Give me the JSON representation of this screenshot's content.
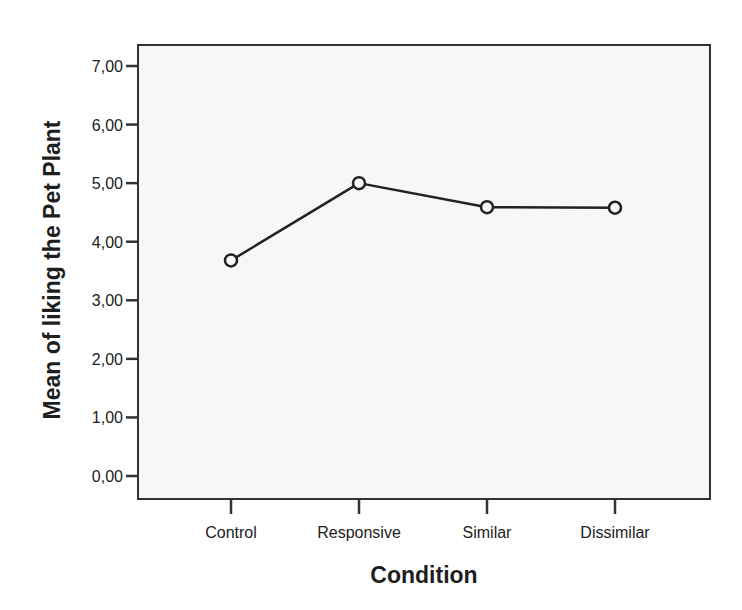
{
  "chart_data": {
    "type": "line",
    "title": "",
    "xlabel": "Condition",
    "ylabel": "Mean of liking the Pet Plant",
    "categories": [
      "Control",
      "Responsive",
      "Similar",
      "Dissimilar"
    ],
    "values": [
      3.68,
      5.0,
      4.59,
      4.58
    ],
    "series": [
      {
        "name": "Mean of liking the Pet Plant",
        "values": [
          3.68,
          5.0,
          4.59,
          4.58
        ],
        "marker": "open-circle",
        "color": "#222222"
      }
    ],
    "ylim": [
      0,
      7
    ],
    "yticks": [
      0,
      1,
      2,
      3,
      4,
      5,
      6,
      7
    ],
    "ytick_labels": [
      "0,00",
      "1,00",
      "2,00",
      "3,00",
      "4,00",
      "5,00",
      "6,00",
      "7,00"
    ],
    "grid": false,
    "legend": "none"
  },
  "colors": {
    "line": "#222222",
    "frame": "#333333",
    "plot_background": "#f7f7f7",
    "page_background": "#ffffff"
  }
}
